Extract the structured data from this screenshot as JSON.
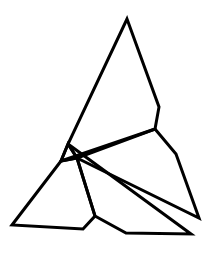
{
  "figure": {
    "type": "line-drawing",
    "width": 219,
    "height": 253,
    "background": "#ffffff",
    "stroke_color": "#000000",
    "stroke_width": 3
  },
  "shapes": [
    {
      "name": "tall-upper-polygon",
      "points": "127,19 159,107 155,129 61,161 68,144"
    },
    {
      "name": "small-center-triangle",
      "points": "68,144 61,161 77,158"
    },
    {
      "name": "right-wing-polygon",
      "points": "155,129 176,154 199,218 77,158"
    },
    {
      "name": "lower-long-triangle",
      "points": "68,144 191,234 126,233 95,216 77,158"
    },
    {
      "name": "lower-left-polygon",
      "points": "61,161 12,225 83,229 95,216 77,158"
    }
  ]
}
